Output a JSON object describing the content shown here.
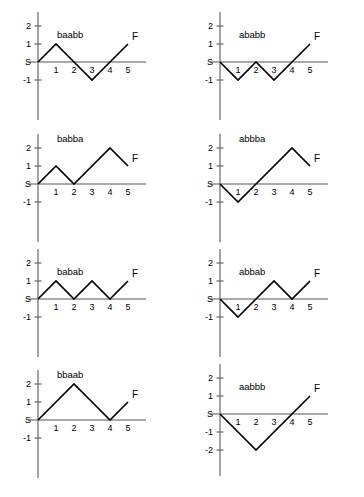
{
  "figure": {
    "panel_count": 8,
    "columns": 2,
    "rows": 4,
    "start_label": "S",
    "end_label": "F",
    "line_color": "#000000",
    "axis_color": "#8d8d8d",
    "background": "#ffffff"
  },
  "chart_data": [
    {
      "type": "line",
      "title": "baabb",
      "xlabel": "",
      "ylabel": "",
      "x": [
        0,
        1,
        2,
        3,
        4,
        5
      ],
      "values": [
        0,
        1,
        0,
        -1,
        0,
        1
      ],
      "steps": [
        "b",
        "a",
        "a",
        "b",
        "b"
      ],
      "xticks": [
        "1",
        "2",
        "3",
        "4",
        "5"
      ],
      "yticks": [
        "2",
        "1",
        "S",
        "-1"
      ],
      "ytick_values": [
        2,
        1,
        0,
        -1
      ],
      "xlim": [
        0,
        6.4
      ],
      "ylim": [
        -2.2,
        2.4
      ],
      "grid": false,
      "legend": "none",
      "annotations": [
        {
          "text": "S",
          "x": 0,
          "y": 0
        },
        {
          "text": "F",
          "x": 5,
          "y": 1
        }
      ]
    },
    {
      "type": "line",
      "title": "ababb",
      "xlabel": "",
      "ylabel": "",
      "x": [
        0,
        1,
        2,
        3,
        4,
        5
      ],
      "values": [
        0,
        -1,
        0,
        -1,
        0,
        1
      ],
      "steps": [
        "a",
        "b",
        "a",
        "b",
        "b"
      ],
      "xticks": [
        "1",
        "2",
        "3",
        "4",
        "5"
      ],
      "yticks": [
        "2",
        "1",
        "S",
        "-1"
      ],
      "ytick_values": [
        2,
        1,
        0,
        -1
      ],
      "xlim": [
        0,
        6.4
      ],
      "ylim": [
        -2.2,
        2.4
      ],
      "grid": false,
      "legend": "none",
      "annotations": [
        {
          "text": "S",
          "x": 0,
          "y": 0
        },
        {
          "text": "F",
          "x": 5,
          "y": 1
        }
      ]
    },
    {
      "type": "line",
      "title": "babba",
      "xlabel": "",
      "ylabel": "",
      "x": [
        0,
        1,
        2,
        3,
        4,
        5
      ],
      "values": [
        0,
        1,
        0,
        1,
        2,
        1
      ],
      "steps": [
        "b",
        "a",
        "b",
        "b",
        "a"
      ],
      "xticks": [
        "1",
        "2",
        "3",
        "4",
        "5"
      ],
      "yticks": [
        "2",
        "1",
        "S",
        "-1"
      ],
      "ytick_values": [
        2,
        1,
        0,
        -1
      ],
      "xlim": [
        0,
        6.4
      ],
      "ylim": [
        -2.2,
        2.4
      ],
      "grid": false,
      "legend": "none",
      "annotations": [
        {
          "text": "S",
          "x": 0,
          "y": 0
        },
        {
          "text": "F",
          "x": 5,
          "y": 1
        }
      ]
    },
    {
      "type": "line",
      "title": "abbba",
      "xlabel": "",
      "ylabel": "",
      "x": [
        0,
        1,
        2,
        3,
        4,
        5
      ],
      "values": [
        0,
        -1,
        0,
        1,
        2,
        1
      ],
      "steps": [
        "a",
        "b",
        "b",
        "b",
        "a"
      ],
      "xticks": [
        "1",
        "2",
        "3",
        "4",
        "5"
      ],
      "yticks": [
        "2",
        "1",
        "S",
        "-1"
      ],
      "ytick_values": [
        2,
        1,
        0,
        -1
      ],
      "xlim": [
        0,
        6.4
      ],
      "ylim": [
        -2.2,
        2.4
      ],
      "grid": false,
      "legend": "none",
      "annotations": [
        {
          "text": "S",
          "x": 0,
          "y": 0
        },
        {
          "text": "F",
          "x": 5,
          "y": 1
        }
      ]
    },
    {
      "type": "line",
      "title": "babab",
      "xlabel": "",
      "ylabel": "",
      "x": [
        0,
        1,
        2,
        3,
        4,
        5
      ],
      "values": [
        0,
        1,
        0,
        1,
        0,
        1
      ],
      "steps": [
        "b",
        "a",
        "b",
        "a",
        "b"
      ],
      "xticks": [
        "1",
        "2",
        "3",
        "4",
        "5"
      ],
      "yticks": [
        "2",
        "1",
        "S",
        "-1"
      ],
      "ytick_values": [
        2,
        1,
        0,
        -1
      ],
      "xlim": [
        0,
        6.4
      ],
      "ylim": [
        -2.2,
        2.4
      ],
      "grid": false,
      "legend": "none",
      "annotations": [
        {
          "text": "S",
          "x": 0,
          "y": 0
        },
        {
          "text": "F",
          "x": 5,
          "y": 1
        }
      ]
    },
    {
      "type": "line",
      "title": "abbab",
      "xlabel": "",
      "ylabel": "",
      "x": [
        0,
        1,
        2,
        3,
        4,
        5
      ],
      "values": [
        0,
        -1,
        0,
        1,
        0,
        1
      ],
      "steps": [
        "a",
        "b",
        "b",
        "a",
        "b"
      ],
      "xticks": [
        "1",
        "2",
        "3",
        "4",
        "5"
      ],
      "yticks": [
        "2",
        "1",
        "S",
        "-1"
      ],
      "ytick_values": [
        2,
        1,
        0,
        -1
      ],
      "xlim": [
        0,
        6.4
      ],
      "ylim": [
        -2.2,
        2.4
      ],
      "grid": false,
      "legend": "none",
      "annotations": [
        {
          "text": "S",
          "x": 0,
          "y": 0
        },
        {
          "text": "F",
          "x": 5,
          "y": 1
        }
      ]
    },
    {
      "type": "line",
      "title": "bbaab",
      "xlabel": "",
      "ylabel": "",
      "x": [
        0,
        1,
        2,
        3,
        4,
        5
      ],
      "values": [
        0,
        1,
        2,
        1,
        0,
        1
      ],
      "steps": [
        "b",
        "b",
        "a",
        "a",
        "b"
      ],
      "xticks": [
        "1",
        "2",
        "3",
        "4",
        "5"
      ],
      "yticks": [
        "2",
        "1",
        "S",
        "-1"
      ],
      "ytick_values": [
        2,
        1,
        0,
        -1
      ],
      "xlim": [
        0,
        6.4
      ],
      "ylim": [
        -2.2,
        2.4
      ],
      "grid": false,
      "legend": "none",
      "annotations": [
        {
          "text": "S",
          "x": 0,
          "y": 0
        },
        {
          "text": "F",
          "x": 5,
          "y": 1
        }
      ]
    },
    {
      "type": "line",
      "title": "aabbb",
      "xlabel": "",
      "ylabel": "",
      "x": [
        0,
        1,
        2,
        3,
        4,
        5
      ],
      "values": [
        0,
        -1,
        -2,
        -1,
        0,
        1
      ],
      "steps": [
        "a",
        "a",
        "b",
        "b",
        "b"
      ],
      "xticks": [
        "1",
        "2",
        "3",
        "4",
        "5"
      ],
      "yticks": [
        "2",
        "1",
        "S",
        "-1",
        "-2"
      ],
      "ytick_values": [
        2,
        1,
        0,
        -1,
        -2
      ],
      "xlim": [
        0,
        6.4
      ],
      "ylim": [
        -2.6,
        2.4
      ],
      "grid": false,
      "legend": "none",
      "annotations": [
        {
          "text": "S",
          "x": 0,
          "y": 0
        },
        {
          "text": "F",
          "x": 5,
          "y": 1
        }
      ]
    }
  ]
}
